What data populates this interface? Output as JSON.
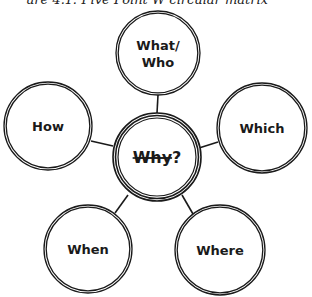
{
  "caption": {
    "text": "ure 4.1: Five Point W circular matrix"
  },
  "diagram": {
    "center": {
      "label_struck": "Why",
      "suffix": "?",
      "cx": 157,
      "cy": 157,
      "r": 44
    },
    "nodes": [
      {
        "id": "what-who",
        "lines": [
          "What/",
          "Who"
        ],
        "cx": 158,
        "cy": 53,
        "r": 42,
        "line": [
          158,
          95,
          157,
          113
        ]
      },
      {
        "id": "how",
        "lines": [
          "How"
        ],
        "cx": 48,
        "cy": 126,
        "r": 44,
        "line": [
          91,
          141,
          113,
          146
        ]
      },
      {
        "id": "which",
        "lines": [
          "Which"
        ],
        "cx": 262,
        "cy": 128,
        "r": 45,
        "line": [
          199,
          148,
          218,
          142
        ]
      },
      {
        "id": "when",
        "lines": [
          "When"
        ],
        "cx": 88,
        "cy": 249,
        "r": 44,
        "line": [
          115,
          213,
          128,
          195
        ]
      },
      {
        "id": "where",
        "lines": [
          "Where"
        ],
        "cx": 220,
        "cy": 250,
        "r": 45,
        "line": [
          193,
          214,
          182,
          195
        ]
      }
    ],
    "colors": {
      "stroke": "#1a1a1a",
      "background": "#ffffff"
    }
  }
}
